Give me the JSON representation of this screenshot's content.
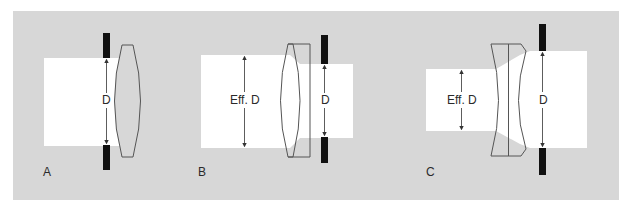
{
  "figure": {
    "panels": [
      {
        "id": "A",
        "label": "A",
        "dimension_labels": [
          "D"
        ],
        "lens_type": "biconvex",
        "stop_position": "front"
      },
      {
        "id": "B",
        "label": "B",
        "dimension_labels": [
          "Eff. D",
          "D"
        ],
        "lens_type": "biconvex-plano",
        "stop_position": "rear"
      },
      {
        "id": "C",
        "label": "C",
        "dimension_labels": [
          "Eff. D",
          "D"
        ],
        "lens_type": "biconcave-doublet",
        "stop_position": "rear"
      }
    ],
    "colors": {
      "background_panel": "#d7d7d7",
      "beam": "#ffffff",
      "stop": "#111111",
      "lens_outline": "#555555",
      "arrow": "#333333"
    }
  }
}
